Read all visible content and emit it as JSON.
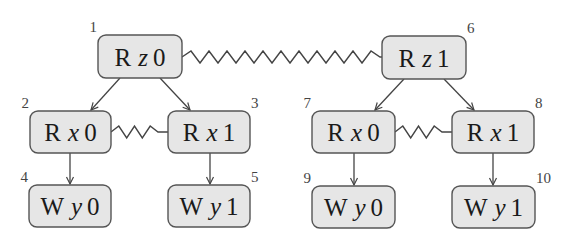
{
  "diagram": {
    "type": "event-structure",
    "colors": {
      "node_fill": "#e6e6e6",
      "node_border": "#555555",
      "edge": "#444444",
      "text": "#1a1a1a"
    },
    "nodes": [
      {
        "id": "1",
        "op": "R",
        "var": "z",
        "val": "0",
        "x": 98,
        "y": 35,
        "w": 84,
        "h": 43,
        "label_pos": "top-left"
      },
      {
        "id": "2",
        "op": "R",
        "var": "x",
        "val": "0",
        "x": 30,
        "y": 111,
        "w": 81,
        "h": 42,
        "label_pos": "top-left"
      },
      {
        "id": "3",
        "op": "R",
        "var": "x",
        "val": "1",
        "x": 168,
        "y": 111,
        "w": 82,
        "h": 42,
        "label_pos": "top-right"
      },
      {
        "id": "4",
        "op": "W",
        "var": "y",
        "val": "0",
        "x": 29,
        "y": 185,
        "w": 82,
        "h": 42,
        "label_pos": "top-left"
      },
      {
        "id": "5",
        "op": "W",
        "var": "y",
        "val": "1",
        "x": 168,
        "y": 185,
        "w": 82,
        "h": 42,
        "label_pos": "top-right"
      },
      {
        "id": "6",
        "op": "R",
        "var": "z",
        "val": "1",
        "x": 382,
        "y": 36,
        "w": 84,
        "h": 43,
        "label_pos": "top-right"
      },
      {
        "id": "7",
        "op": "R",
        "var": "x",
        "val": "0",
        "x": 312,
        "y": 111,
        "w": 83,
        "h": 42,
        "label_pos": "top-left"
      },
      {
        "id": "8",
        "op": "R",
        "var": "x",
        "val": "1",
        "x": 452,
        "y": 111,
        "w": 82,
        "h": 42,
        "label_pos": "top-right"
      },
      {
        "id": "9",
        "op": "W",
        "var": "y",
        "val": "0",
        "x": 312,
        "y": 186,
        "w": 83,
        "h": 42,
        "label_pos": "top-left"
      },
      {
        "id": "10",
        "op": "W",
        "var": "y",
        "val": "1",
        "x": 452,
        "y": 186,
        "w": 83,
        "h": 42,
        "label_pos": "top-right"
      }
    ],
    "edges": [
      {
        "from": "1",
        "to": "2",
        "kind": "arrow",
        "x1": 120,
        "y1": 78,
        "x2": 91,
        "y2": 110
      },
      {
        "from": "1",
        "to": "3",
        "kind": "arrow",
        "x1": 160,
        "y1": 78,
        "x2": 190,
        "y2": 110
      },
      {
        "from": "2",
        "to": "4",
        "kind": "arrow",
        "x1": 70,
        "y1": 153,
        "x2": 70,
        "y2": 184
      },
      {
        "from": "3",
        "to": "5",
        "kind": "arrow",
        "x1": 210,
        "y1": 153,
        "x2": 210,
        "y2": 184
      },
      {
        "from": "6",
        "to": "7",
        "kind": "arrow",
        "x1": 404,
        "y1": 79,
        "x2": 375,
        "y2": 110
      },
      {
        "from": "6",
        "to": "8",
        "kind": "arrow",
        "x1": 444,
        "y1": 79,
        "x2": 474,
        "y2": 110
      },
      {
        "from": "7",
        "to": "9",
        "kind": "arrow",
        "x1": 354,
        "y1": 153,
        "x2": 354,
        "y2": 185
      },
      {
        "from": "8",
        "to": "10",
        "kind": "arrow",
        "x1": 493,
        "y1": 153,
        "x2": 493,
        "y2": 185
      }
    ],
    "conflicts": [
      {
        "between": [
          "1",
          "6"
        ],
        "kind": "zigzag",
        "x1": 182,
        "x2": 382,
        "y": 57,
        "peaks": 11,
        "amp": 6,
        "tail": 2
      },
      {
        "between": [
          "2",
          "3"
        ],
        "kind": "zigzag",
        "x1": 111,
        "x2": 168,
        "y": 132,
        "peaks": 3,
        "amp": 6,
        "tail": 10
      },
      {
        "between": [
          "7",
          "8"
        ],
        "kind": "zigzag",
        "x1": 395,
        "x2": 452,
        "y": 132,
        "peaks": 3,
        "amp": 6,
        "tail": 10
      }
    ]
  }
}
